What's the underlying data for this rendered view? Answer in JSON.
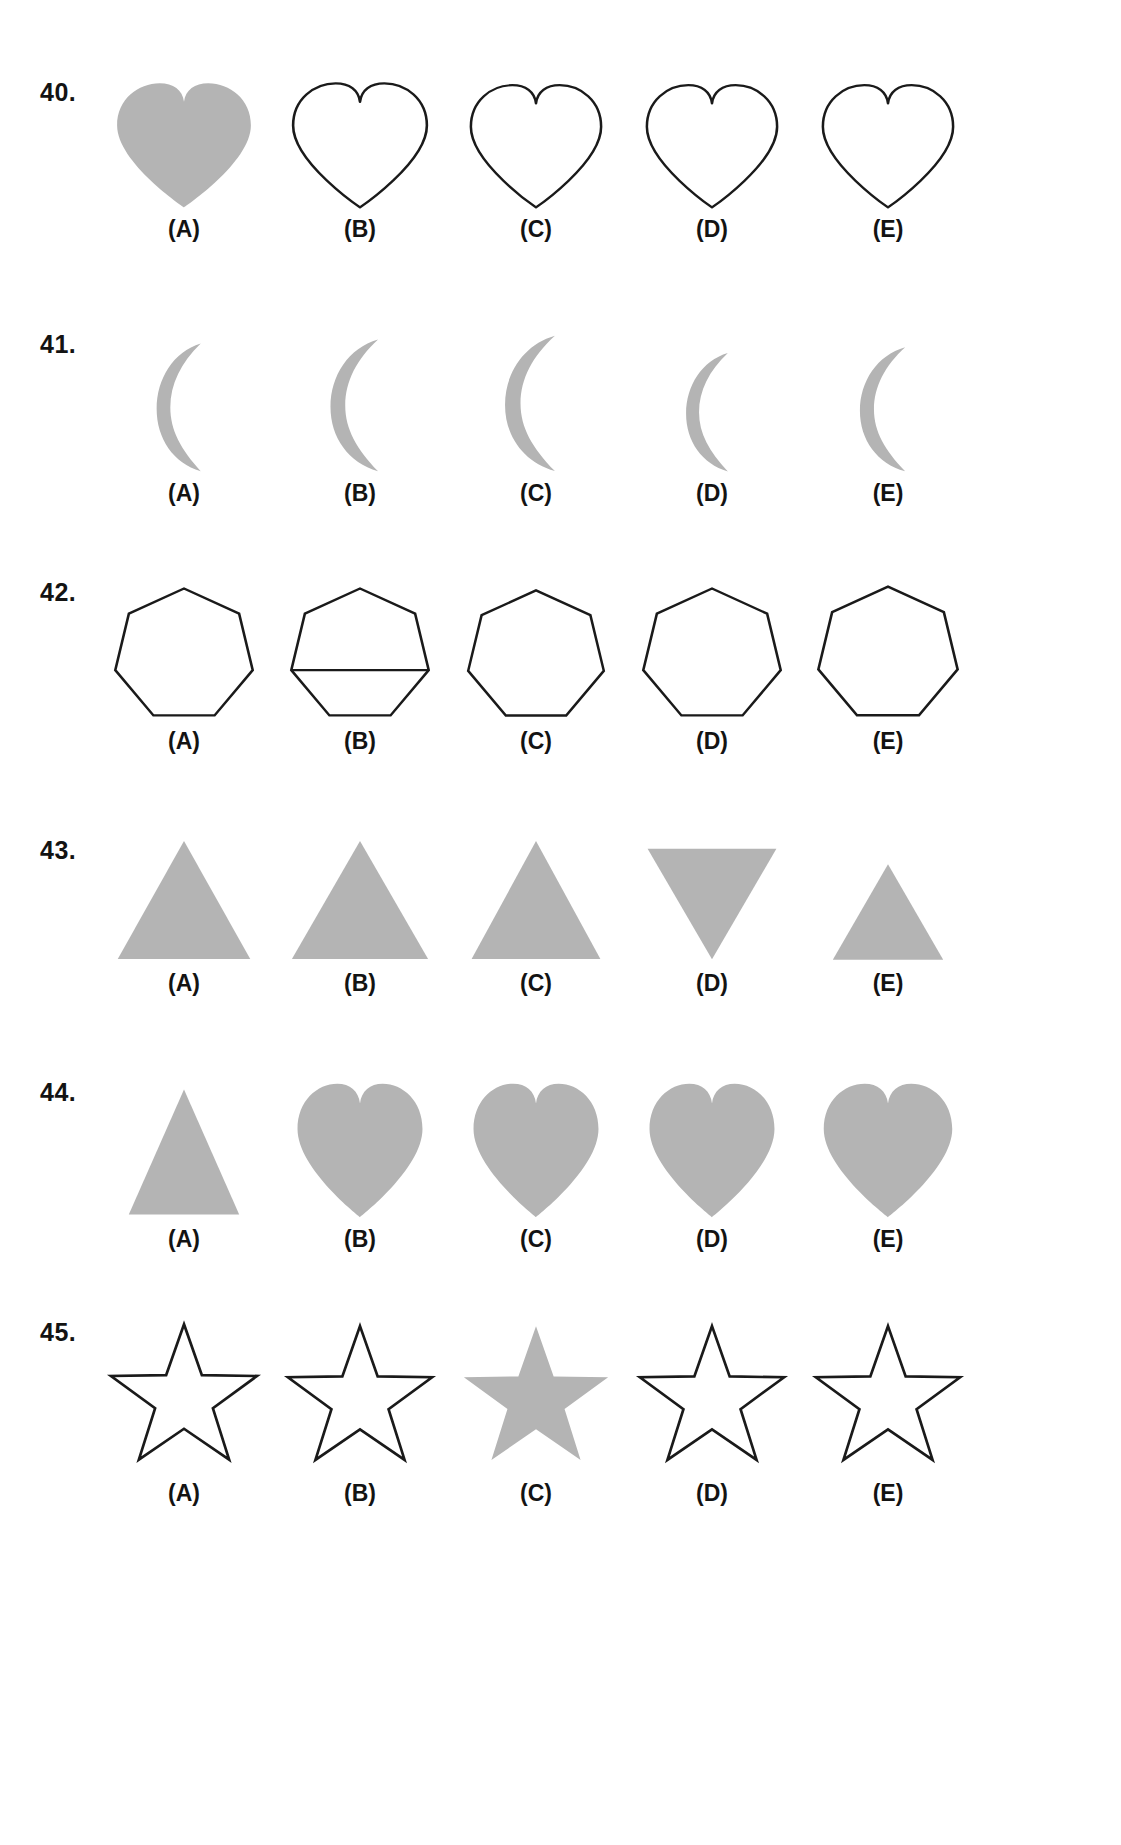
{
  "page": {
    "background_color": "#ffffff",
    "fill_gray": "#b4b4b4",
    "stroke_black": "#1a1a1a",
    "text_color": "#131313"
  },
  "option_labels": [
    "(A)",
    "(B)",
    "(C)",
    "(D)",
    "(E)"
  ],
  "rows": [
    {
      "number": "40.",
      "shape": "heart",
      "options": [
        {
          "label": "(A)",
          "shape": "heart",
          "filled": true,
          "width": 152,
          "height": 132,
          "rotation": 0
        },
        {
          "label": "(B)",
          "shape": "heart",
          "filled": false,
          "width": 152,
          "height": 132,
          "rotation": 0
        },
        {
          "label": "(C)",
          "shape": "heart",
          "filled": false,
          "width": 148,
          "height": 130,
          "rotation": 0
        },
        {
          "label": "(D)",
          "shape": "heart",
          "filled": false,
          "width": 148,
          "height": 130,
          "rotation": 0
        },
        {
          "label": "(E)",
          "shape": "heart",
          "filled": false,
          "width": 148,
          "height": 130,
          "rotation": 0
        }
      ]
    },
    {
      "number": "41.",
      "shape": "crescent",
      "options": [
        {
          "label": "(A)",
          "shape": "crescent",
          "filled": true,
          "width": 76,
          "height": 136,
          "rotation": 0
        },
        {
          "label": "(B)",
          "shape": "crescent",
          "filled": true,
          "width": 82,
          "height": 140,
          "rotation": 0
        },
        {
          "label": "(C)",
          "shape": "crescent",
          "filled": true,
          "width": 86,
          "height": 144,
          "rotation": 0
        },
        {
          "label": "(D)",
          "shape": "crescent",
          "filled": true,
          "width": 72,
          "height": 126,
          "rotation": 0
        },
        {
          "label": "(E)",
          "shape": "crescent",
          "filled": true,
          "width": 78,
          "height": 132,
          "rotation": 0
        }
      ]
    },
    {
      "number": "42.",
      "shape": "heptagon",
      "options": [
        {
          "label": "(A)",
          "shape": "heptagon",
          "filled": false,
          "width": 150,
          "height": 142,
          "rotation": 0
        },
        {
          "label": "(B)",
          "shape": "heptagon-with-line",
          "filled": false,
          "width": 150,
          "height": 142,
          "rotation": 0
        },
        {
          "label": "(C)",
          "shape": "heptagon",
          "filled": false,
          "width": 148,
          "height": 140,
          "rotation": 0
        },
        {
          "label": "(D)",
          "shape": "heptagon",
          "filled": false,
          "width": 150,
          "height": 142,
          "rotation": 0
        },
        {
          "label": "(E)",
          "shape": "heptagon",
          "filled": false,
          "width": 152,
          "height": 144,
          "rotation": 0
        }
      ]
    },
    {
      "number": "43.",
      "shape": "triangle",
      "options": [
        {
          "label": "(A)",
          "shape": "triangle",
          "filled": true,
          "width": 144,
          "height": 128,
          "rotation": 0
        },
        {
          "label": "(B)",
          "shape": "triangle",
          "filled": true,
          "width": 148,
          "height": 128,
          "rotation": 0
        },
        {
          "label": "(C)",
          "shape": "triangle",
          "filled": true,
          "width": 140,
          "height": 128,
          "rotation": 0
        },
        {
          "label": "(D)",
          "shape": "triangle",
          "filled": true,
          "width": 140,
          "height": 120,
          "rotation": 180
        },
        {
          "label": "(E)",
          "shape": "triangle",
          "filled": true,
          "width": 120,
          "height": 104,
          "rotation": 0
        }
      ]
    },
    {
      "number": "44.",
      "shape": "mixed",
      "options": [
        {
          "label": "(A)",
          "shape": "triangle",
          "filled": true,
          "width": 120,
          "height": 136,
          "rotation": 0
        },
        {
          "label": "(B)",
          "shape": "heart",
          "filled": true,
          "width": 142,
          "height": 142,
          "rotation": 0
        },
        {
          "label": "(C)",
          "shape": "heart",
          "filled": true,
          "width": 142,
          "height": 142,
          "rotation": 0
        },
        {
          "label": "(D)",
          "shape": "heart",
          "filled": true,
          "width": 142,
          "height": 142,
          "rotation": 0
        },
        {
          "label": "(E)",
          "shape": "heart",
          "filled": true,
          "width": 146,
          "height": 142,
          "rotation": 0
        }
      ]
    },
    {
      "number": "45.",
      "shape": "star",
      "options": [
        {
          "label": "(A)",
          "shape": "star",
          "filled": false,
          "width": 160,
          "height": 156,
          "rotation": 0
        },
        {
          "label": "(B)",
          "shape": "star",
          "filled": false,
          "width": 158,
          "height": 154,
          "rotation": 0
        },
        {
          "label": "(C)",
          "shape": "star",
          "filled": true,
          "width": 158,
          "height": 154,
          "rotation": 0
        },
        {
          "label": "(D)",
          "shape": "star",
          "filled": false,
          "width": 158,
          "height": 154,
          "rotation": 0
        },
        {
          "label": "(E)",
          "shape": "star",
          "filled": false,
          "width": 158,
          "height": 154,
          "rotation": 0
        }
      ]
    }
  ],
  "layout": {
    "row_tops": [
      78,
      330,
      578,
      836,
      1078,
      1318
    ],
    "number_left": 40,
    "options_left": 96,
    "column_width": 176
  }
}
